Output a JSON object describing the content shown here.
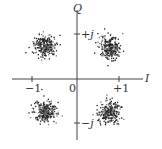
{
  "diagram": {
    "type": "QPSK constellation (scatter)",
    "axes": {
      "horizontal_label": "I",
      "vertical_label": "Q",
      "origin_label": "0",
      "x_ticks": [
        "−1",
        "+1"
      ],
      "y_ticks": [
        "+j",
        "−j"
      ]
    },
    "clusters": [
      {
        "name": "upper-left",
        "center": [
          -0.75,
          0.75
        ]
      },
      {
        "name": "upper-right",
        "center": [
          0.75,
          0.72
        ]
      },
      {
        "name": "lower-left",
        "center": [
          -0.75,
          -0.72
        ]
      },
      {
        "name": "lower-right",
        "center": [
          0.73,
          -0.74
        ]
      }
    ],
    "colors": {
      "axis": "#444444",
      "points": "#222222"
    }
  }
}
